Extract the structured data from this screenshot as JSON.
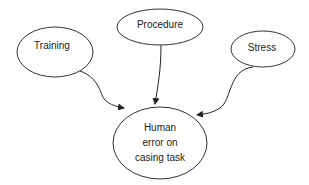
{
  "diagram": {
    "type": "influence-diagram",
    "nodes": [
      {
        "id": "training",
        "label": "Training",
        "cx": 55,
        "cy": 52,
        "rx": 38,
        "ry": 25
      },
      {
        "id": "procedure",
        "label": "Procedure",
        "cx": 160,
        "cy": 27,
        "rx": 43,
        "ry": 18
      },
      {
        "id": "stress",
        "label": "Stress",
        "cx": 263,
        "cy": 49,
        "rx": 32,
        "ry": 18
      },
      {
        "id": "human-error",
        "label_lines": [
          "Human",
          "error on",
          "casing task"
        ],
        "cx": 160,
        "cy": 143,
        "rx": 47,
        "ry": 36
      }
    ],
    "edges": [
      {
        "from": "training",
        "to": "human-error"
      },
      {
        "from": "procedure",
        "to": "human-error"
      },
      {
        "from": "stress",
        "to": "human-error"
      }
    ]
  }
}
